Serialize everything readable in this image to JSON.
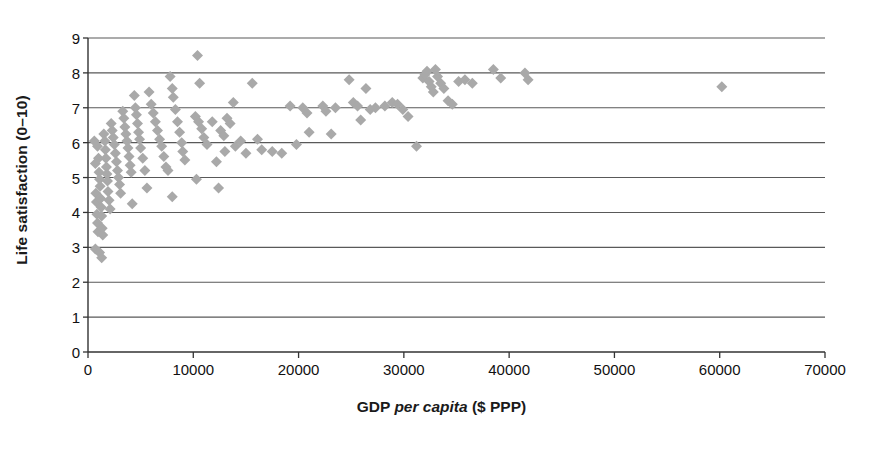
{
  "chart_data": {
    "type": "scatter",
    "title": "",
    "xlabel_parts": [
      {
        "text": "GDP ",
        "style": "bold"
      },
      {
        "text": "per capita",
        "style": "bold-italic"
      },
      {
        "text": " ($ PPP)",
        "style": "bold"
      }
    ],
    "xlabel": "GDP per capita ($ PPP)",
    "ylabel": "Life satisfaction (0–10)",
    "xlim": [
      0,
      70000
    ],
    "ylim": [
      0,
      9
    ],
    "xticks": [
      0,
      10000,
      20000,
      30000,
      40000,
      50000,
      60000,
      70000
    ],
    "xtick_labels": [
      "0",
      "10000",
      "20000",
      "30000",
      "40000",
      "50000",
      "60000",
      "70000"
    ],
    "yticks": [
      0,
      1,
      2,
      3,
      4,
      5,
      6,
      7,
      8,
      9
    ],
    "ytick_labels": [
      "0",
      "1",
      "2",
      "3",
      "4",
      "5",
      "6",
      "7",
      "8",
      "9"
    ],
    "grid": "horizontal",
    "grid_color": "#595959",
    "axis_color": "#333333",
    "marker": "diamond",
    "marker_color": "#a9a9a9",
    "marker_size": 11,
    "legend": null,
    "series": [
      {
        "name": "Countries",
        "points": [
          [
            600,
            6.05
          ],
          [
            700,
            5.4
          ],
          [
            750,
            4.55
          ],
          [
            800,
            4.3
          ],
          [
            850,
            3.95
          ],
          [
            900,
            3.7
          ],
          [
            950,
            3.45
          ],
          [
            700,
            2.95
          ],
          [
            1100,
            2.85
          ],
          [
            1300,
            2.7
          ],
          [
            900,
            5.9
          ],
          [
            1000,
            5.55
          ],
          [
            1050,
            5.15
          ],
          [
            1100,
            4.95
          ],
          [
            1150,
            4.75
          ],
          [
            1200,
            4.4
          ],
          [
            1250,
            4.15
          ],
          [
            1300,
            3.9
          ],
          [
            1350,
            3.55
          ],
          [
            1400,
            3.35
          ],
          [
            1500,
            6.25
          ],
          [
            1600,
            6.05
          ],
          [
            1650,
            5.8
          ],
          [
            1700,
            5.55
          ],
          [
            1750,
            5.3
          ],
          [
            1800,
            5.1
          ],
          [
            1850,
            4.9
          ],
          [
            1900,
            4.6
          ],
          [
            2000,
            4.35
          ],
          [
            2100,
            4.1
          ],
          [
            2200,
            6.55
          ],
          [
            2300,
            6.35
          ],
          [
            2400,
            6.15
          ],
          [
            2500,
            5.95
          ],
          [
            2600,
            5.7
          ],
          [
            2700,
            5.45
          ],
          [
            2800,
            5.2
          ],
          [
            2900,
            5.0
          ],
          [
            3000,
            4.8
          ],
          [
            3100,
            4.55
          ],
          [
            3300,
            6.9
          ],
          [
            3400,
            6.7
          ],
          [
            3500,
            6.45
          ],
          [
            3600,
            6.25
          ],
          [
            3700,
            6.05
          ],
          [
            3800,
            5.85
          ],
          [
            3900,
            5.6
          ],
          [
            4000,
            5.35
          ],
          [
            4100,
            5.15
          ],
          [
            4200,
            4.25
          ],
          [
            4400,
            7.35
          ],
          [
            4500,
            7.0
          ],
          [
            4600,
            6.8
          ],
          [
            4700,
            6.55
          ],
          [
            4800,
            6.3
          ],
          [
            4900,
            6.1
          ],
          [
            5000,
            5.85
          ],
          [
            5200,
            5.55
          ],
          [
            5400,
            5.2
          ],
          [
            5600,
            4.7
          ],
          [
            5800,
            7.45
          ],
          [
            6000,
            7.1
          ],
          [
            6200,
            6.85
          ],
          [
            6400,
            6.6
          ],
          [
            6600,
            6.35
          ],
          [
            6800,
            6.1
          ],
          [
            7000,
            5.9
          ],
          [
            7200,
            5.6
          ],
          [
            7400,
            5.3
          ],
          [
            7600,
            5.2
          ],
          [
            7800,
            7.9
          ],
          [
            8000,
            7.55
          ],
          [
            8100,
            7.3
          ],
          [
            8300,
            6.95
          ],
          [
            8500,
            6.6
          ],
          [
            8700,
            6.3
          ],
          [
            8900,
            6.0
          ],
          [
            9000,
            5.75
          ],
          [
            9200,
            5.5
          ],
          [
            8000,
            4.45
          ],
          [
            10400,
            8.5
          ],
          [
            10600,
            7.7
          ],
          [
            10200,
            6.75
          ],
          [
            10500,
            6.6
          ],
          [
            10800,
            6.4
          ],
          [
            11000,
            6.15
          ],
          [
            11300,
            5.95
          ],
          [
            10300,
            4.95
          ],
          [
            12400,
            4.7
          ],
          [
            11800,
            6.6
          ],
          [
            12600,
            6.35
          ],
          [
            12900,
            6.2
          ],
          [
            13200,
            6.7
          ],
          [
            13500,
            6.55
          ],
          [
            13800,
            7.15
          ],
          [
            12200,
            5.45
          ],
          [
            13000,
            5.75
          ],
          [
            14000,
            5.9
          ],
          [
            14500,
            6.05
          ],
          [
            15000,
            5.7
          ],
          [
            15600,
            7.7
          ],
          [
            16100,
            6.1
          ],
          [
            16500,
            5.8
          ],
          [
            17500,
            5.75
          ],
          [
            18400,
            5.7
          ],
          [
            19200,
            7.05
          ],
          [
            19800,
            5.95
          ],
          [
            20400,
            7.0
          ],
          [
            20800,
            6.85
          ],
          [
            21000,
            6.3
          ],
          [
            22300,
            7.05
          ],
          [
            22600,
            6.9
          ],
          [
            23100,
            6.25
          ],
          [
            23500,
            7.0
          ],
          [
            24800,
            7.8
          ],
          [
            25200,
            7.15
          ],
          [
            25600,
            7.05
          ],
          [
            25900,
            6.65
          ],
          [
            26400,
            7.55
          ],
          [
            26800,
            6.95
          ],
          [
            27300,
            7.0
          ],
          [
            28200,
            7.05
          ],
          [
            28900,
            7.15
          ],
          [
            29400,
            7.1
          ],
          [
            29900,
            6.95
          ],
          [
            30400,
            6.75
          ],
          [
            31200,
            5.9
          ],
          [
            31800,
            7.85
          ],
          [
            32000,
            7.95
          ],
          [
            32200,
            8.05
          ],
          [
            32400,
            7.75
          ],
          [
            32600,
            7.6
          ],
          [
            32800,
            7.45
          ],
          [
            33000,
            8.1
          ],
          [
            33200,
            7.9
          ],
          [
            33500,
            7.7
          ],
          [
            33800,
            7.55
          ],
          [
            34200,
            7.2
          ],
          [
            34600,
            7.1
          ],
          [
            35200,
            7.75
          ],
          [
            35800,
            7.8
          ],
          [
            36500,
            7.7
          ],
          [
            38500,
            8.1
          ],
          [
            39200,
            7.85
          ],
          [
            41500,
            8.0
          ],
          [
            41800,
            7.8
          ],
          [
            60200,
            7.6
          ]
        ]
      }
    ]
  },
  "axes": {
    "plot_left_px": 88,
    "plot_right_px": 825,
    "plot_top_px": 38,
    "plot_bottom_px": 352
  }
}
